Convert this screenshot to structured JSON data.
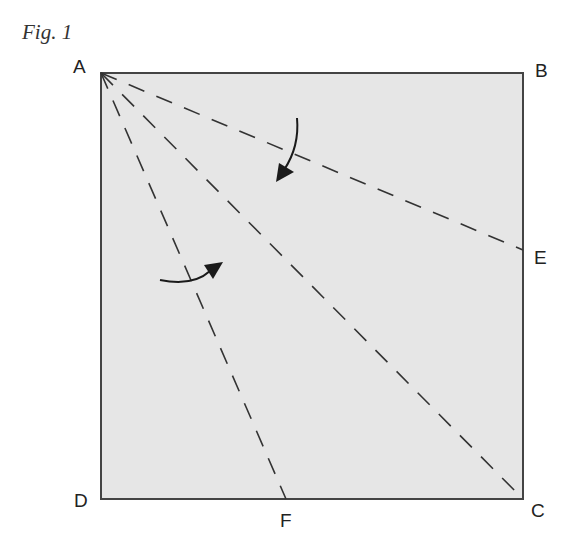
{
  "figure": {
    "title": "Fig. 1",
    "square": {
      "x1": 101,
      "y1": 73,
      "x2": 523,
      "y2": 499,
      "fill": "#e6e6e6",
      "stroke": "#444444"
    },
    "points": [
      {
        "name": "A",
        "x": 101,
        "y": 73
      },
      {
        "name": "B",
        "x": 523,
        "y": 73
      },
      {
        "name": "C",
        "x": 523,
        "y": 499
      },
      {
        "name": "D",
        "x": 101,
        "y": 499
      },
      {
        "name": "E",
        "x": 523,
        "y": 250
      },
      {
        "name": "F",
        "x": 286,
        "y": 499
      }
    ],
    "labels": {
      "A": "A",
      "B": "B",
      "C": "C",
      "D": "D",
      "E": "E",
      "F": "F"
    },
    "fold_lines": [
      {
        "from": "A",
        "to": "E",
        "style": "dashed"
      },
      {
        "from": "A",
        "to": "C",
        "style": "dashed"
      },
      {
        "from": "A",
        "to": "F",
        "style": "dashed"
      }
    ],
    "arrows": [
      {
        "name": "fold-arrow-top",
        "direction": "down-left"
      },
      {
        "name": "fold-arrow-bottom",
        "direction": "up-right"
      }
    ]
  }
}
